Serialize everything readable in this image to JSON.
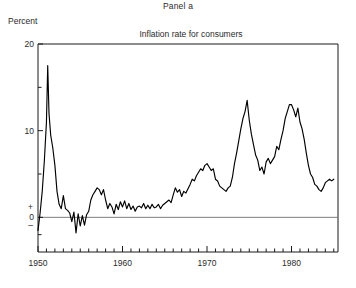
{
  "panel": {
    "label": "Panel a"
  },
  "axis": {
    "unit_label": "Percent"
  },
  "chart_data": {
    "type": "line",
    "title": "Inflation rate for consumers",
    "xlabel": "",
    "ylabel": "Percent",
    "xlim": [
      1950,
      1985.5
    ],
    "ylim": [
      -4,
      20
    ],
    "grid": false,
    "legend": null,
    "zero_line": 0,
    "y_ticks": [
      0,
      10,
      20
    ],
    "y_tick_labels": [
      "0",
      "10",
      "20"
    ],
    "y_minor_ticks": [
      -2,
      5,
      15
    ],
    "y_sign_labels": {
      "positive": "+",
      "negative": "–"
    },
    "x_ticks": [
      1950,
      1960,
      1970,
      1980
    ],
    "x_tick_labels": [
      "1950",
      "1960",
      "1970",
      "1980"
    ],
    "x_minor_tick_interval": 1,
    "line_color": "#000000",
    "series_name": "Inflation rate for consumers",
    "x": [
      1950.0,
      1950.25,
      1950.5,
      1950.75,
      1951.0,
      1951.15,
      1951.3,
      1951.5,
      1951.75,
      1952.0,
      1952.25,
      1952.5,
      1952.75,
      1953.0,
      1953.25,
      1953.5,
      1953.75,
      1954.0,
      1954.25,
      1954.5,
      1954.75,
      1955.0,
      1955.25,
      1955.5,
      1955.75,
      1956.0,
      1956.25,
      1956.5,
      1956.75,
      1957.0,
      1957.25,
      1957.5,
      1957.75,
      1958.0,
      1958.25,
      1958.5,
      1958.75,
      1959.0,
      1959.25,
      1959.5,
      1959.75,
      1960.0,
      1960.25,
      1960.5,
      1960.75,
      1961.0,
      1961.25,
      1961.5,
      1961.75,
      1962.0,
      1962.25,
      1962.5,
      1962.75,
      1963.0,
      1963.25,
      1963.5,
      1963.75,
      1964.0,
      1964.25,
      1964.5,
      1964.75,
      1965.0,
      1965.25,
      1965.5,
      1965.75,
      1966.0,
      1966.25,
      1966.5,
      1966.75,
      1967.0,
      1967.25,
      1967.5,
      1967.75,
      1968.0,
      1968.25,
      1968.5,
      1968.75,
      1969.0,
      1969.25,
      1969.5,
      1969.75,
      1970.0,
      1970.25,
      1970.5,
      1970.75,
      1971.0,
      1971.25,
      1971.5,
      1971.75,
      1972.0,
      1972.25,
      1972.5,
      1972.75,
      1973.0,
      1973.25,
      1973.5,
      1973.75,
      1974.0,
      1974.25,
      1974.5,
      1974.75,
      1975.0,
      1975.25,
      1975.5,
      1975.75,
      1976.0,
      1976.25,
      1976.5,
      1976.75,
      1977.0,
      1977.25,
      1977.5,
      1977.75,
      1978.0,
      1978.25,
      1978.5,
      1978.75,
      1979.0,
      1979.25,
      1979.5,
      1979.75,
      1980.0,
      1980.25,
      1980.5,
      1980.75,
      1981.0,
      1981.25,
      1981.5,
      1981.75,
      1982.0,
      1982.25,
      1982.5,
      1982.75,
      1983.0,
      1983.25,
      1983.5,
      1983.75,
      1984.0,
      1984.25,
      1984.5,
      1984.75,
      1985.0
    ],
    "values": [
      -1.5,
      0.5,
      3.0,
      6.5,
      11.0,
      17.5,
      12.0,
      9.5,
      8.0,
      6.0,
      3.0,
      1.5,
      1.0,
      2.5,
      1.0,
      0.8,
      0.5,
      -0.5,
      0.6,
      -1.8,
      0.4,
      -1.0,
      0.2,
      -0.9,
      0.3,
      0.7,
      2.0,
      2.6,
      3.0,
      3.4,
      3.2,
      2.6,
      3.2,
      2.0,
      1.0,
      1.6,
      1.2,
      0.4,
      1.5,
      0.9,
      1.8,
      1.2,
      1.9,
      1.0,
      1.6,
      0.9,
      1.3,
      0.7,
      1.2,
      1.3,
      1.1,
      1.6,
      1.0,
      1.4,
      1.0,
      1.5,
      1.1,
      1.2,
      1.5,
      1.0,
      1.4,
      1.6,
      1.8,
      2.0,
      1.7,
      2.6,
      3.4,
      2.9,
      3.2,
      2.4,
      3.0,
      2.8,
      3.3,
      3.8,
      4.4,
      4.2,
      4.8,
      5.2,
      5.6,
      5.4,
      6.0,
      6.2,
      5.8,
      5.4,
      5.6,
      4.4,
      4.2,
      3.6,
      3.4,
      3.2,
      3.0,
      3.4,
      3.6,
      4.6,
      6.2,
      7.4,
      8.8,
      10.2,
      11.4,
      12.2,
      13.5,
      11.2,
      9.6,
      8.4,
      7.2,
      6.6,
      5.4,
      5.8,
      5.0,
      6.4,
      6.8,
      6.2,
      6.6,
      7.0,
      8.2,
      7.8,
      9.0,
      10.0,
      11.4,
      12.2,
      13.0,
      13.0,
      12.4,
      11.6,
      12.6,
      11.0,
      10.2,
      9.0,
      7.4,
      6.0,
      5.0,
      4.6,
      3.8,
      3.6,
      3.2,
      3.0,
      3.4,
      4.0,
      4.2,
      4.4,
      4.2,
      4.4
    ]
  }
}
